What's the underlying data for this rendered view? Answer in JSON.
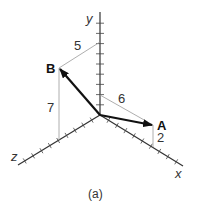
{
  "figure": {
    "caption": "(a)",
    "axes": {
      "x": "x",
      "y": "y",
      "z": "z"
    },
    "vectors": [
      {
        "name": "A",
        "components_label": {
          "x": "6",
          "y": "2"
        }
      },
      {
        "name": "B",
        "components_label": {
          "z": "5",
          "y": "7"
        }
      }
    ],
    "dimension_labels": {
      "b_horizontal": "5",
      "b_vertical": "7",
      "a_horizontal": "6",
      "a_vertical": "2"
    },
    "colors": {
      "axis": "#333333",
      "vector": "#111111",
      "guide": "#999999"
    }
  }
}
